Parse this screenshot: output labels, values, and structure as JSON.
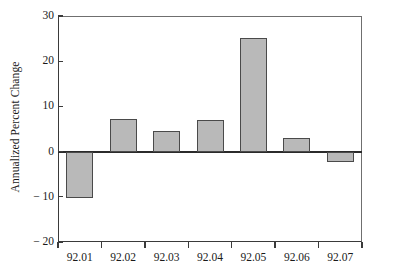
{
  "chart_data": {
    "type": "bar",
    "title": "",
    "subtitle": "",
    "xlabel": "",
    "ylabel": "Annualized Percent Change",
    "categories": [
      "92.01",
      "92.02",
      "92.03",
      "92.04",
      "92.05",
      "92.06",
      "92.07"
    ],
    "values": [
      -10.3,
      7.3,
      4.6,
      6.9,
      25.2,
      3.0,
      -2.2
    ],
    "series": [
      {
        "name": "Annualized Percent Change",
        "values": [
          -10.3,
          7.3,
          4.6,
          6.9,
          25.2,
          3.0,
          -2.2
        ]
      }
    ],
    "ylim": [
      -20,
      30
    ],
    "yticks": [
      30,
      20,
      10,
      0,
      -10,
      -20
    ],
    "ytick_labels": [
      "30",
      "20",
      "10",
      "0",
      "− 10",
      "− 20"
    ],
    "xtick_labels": [
      "92.01",
      "92.02",
      "92.03",
      "92.04",
      "92.05",
      "92.06",
      "92.07"
    ],
    "grid": false,
    "legend": false,
    "legend_position": "none",
    "zero_line": 0,
    "bar_fill_color": "#b9b9b9",
    "bar_edge_color": "#4a4a4a",
    "axis_color": "#3a3a3a",
    "background_color": "#ffffff"
  }
}
